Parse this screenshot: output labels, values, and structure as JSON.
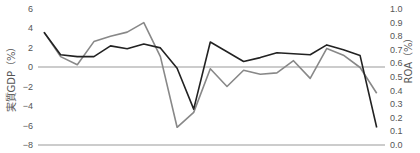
{
  "chart_data": {
    "type": "line",
    "title": "",
    "x": [
      1,
      2,
      3,
      4,
      5,
      6,
      7,
      8,
      9,
      10,
      11,
      12,
      13,
      14,
      15,
      16,
      17,
      18,
      19,
      20,
      21
    ],
    "series": [
      {
        "name": "実質GDP",
        "axis": "left",
        "color": "#222222",
        "values": [
          3.6,
          1.3,
          1.1,
          1.1,
          2.2,
          1.9,
          2.4,
          2.0,
          -0.1,
          -4.3,
          2.6,
          1.6,
          0.6,
          1.0,
          1.5,
          1.4,
          1.3,
          2.3,
          1.8,
          1.2,
          -6.2
        ]
      },
      {
        "name": "ROA",
        "axis": "right",
        "color": "#888888",
        "values": [
          0.83,
          0.65,
          0.59,
          0.76,
          0.8,
          0.83,
          0.9,
          0.65,
          0.13,
          0.24,
          0.56,
          0.43,
          0.55,
          0.52,
          0.53,
          0.62,
          0.49,
          0.71,
          0.66,
          0.57,
          0.38
        ]
      }
    ],
    "ylabel_left": "実質GDP（%）",
    "ylabel_right": "ROA（%）",
    "ylim_left": [
      -8,
      6
    ],
    "ylim_right": [
      0.0,
      1.0
    ],
    "yticks_left": [
      "6",
      "4",
      "2",
      "0",
      "−2",
      "−4",
      "−6",
      "−8"
    ],
    "yticks_right": [
      "1.0",
      "0.9",
      "0.8",
      "0.7",
      "0.6",
      "0.5",
      "0.4",
      "0.3",
      "0.2",
      "0.1",
      "0.0"
    ],
    "reference_lines": [
      {
        "axis": "left",
        "value": 0
      },
      {
        "axis": "left",
        "value": -8
      }
    ],
    "grid": false,
    "legend": "none"
  }
}
